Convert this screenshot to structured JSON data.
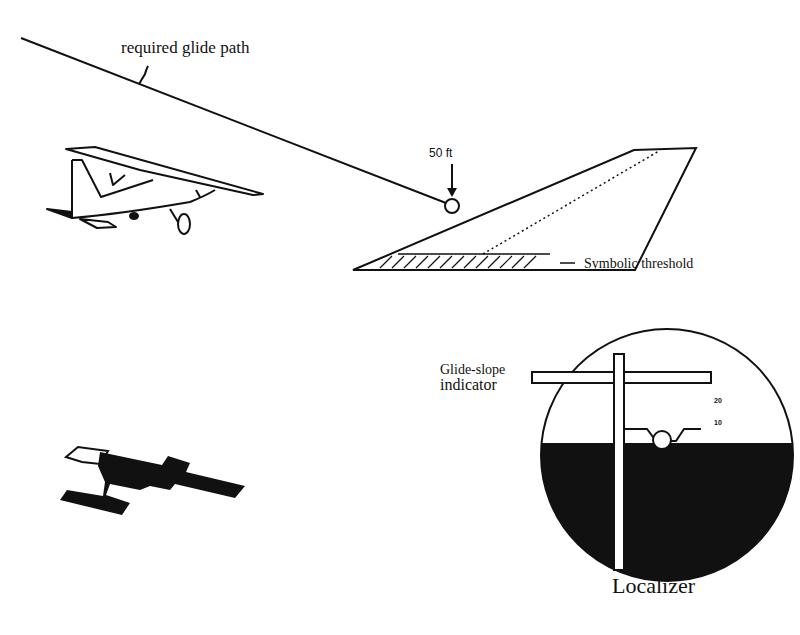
{
  "diagram": {
    "labels": {
      "glide_path": "required glide path",
      "altitude_marker": "50 ft",
      "threshold": "Symbolic threshold",
      "glide_slope_line1": "Glide-slope",
      "glide_slope_line2": "indicator",
      "localizer": "Localizer"
    },
    "attitude_indicator": {
      "tick_labels": [
        "20",
        "10"
      ]
    },
    "icons": {
      "side_airplane": "airplane-side-view-icon",
      "top_airplane": "airplane-top-view-silhouette-icon",
      "runway": "runway-perspective-icon",
      "instrument": "ils-attitude-indicator-icon"
    },
    "colors": {
      "ink": "#111111",
      "background": "#ffffff"
    }
  }
}
